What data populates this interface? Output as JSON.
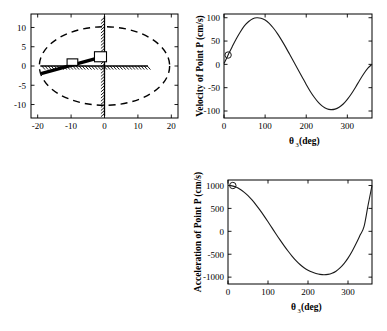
{
  "figure": {
    "title": "",
    "panels": [
      "mechanism-plot",
      "velocity-plot",
      "acceleration-plot"
    ]
  },
  "mechanism": {
    "name": "slider-crank-mechanism-diagram",
    "xlabel": "",
    "ylabel": "",
    "xticks": [
      "-20",
      "-10",
      "0",
      "10",
      "20"
    ],
    "xtick_values": [
      -20,
      -10,
      0,
      10,
      20
    ],
    "yticks": [
      "10",
      "5",
      "0",
      "-5",
      "-10"
    ],
    "ytick_values": [
      10,
      5,
      0,
      -5,
      -10
    ],
    "xlim": [
      -22,
      22
    ],
    "ylim": [
      -13.5,
      13.5
    ],
    "ellipse": {
      "cx": 0,
      "cy": 0,
      "rx": 19.5,
      "ry": 10.2,
      "style": "dashed"
    },
    "vertical_guide": {
      "x": 0,
      "y_from": -13.0,
      "y_to": 13.0,
      "hatch_side": "left"
    },
    "horizontal_guide": {
      "y": 0,
      "x_from": -19.2,
      "x_to": 13.0,
      "hatch_side": "below"
    },
    "bar": {
      "x1": -19.0,
      "y1": -2.0,
      "x2": -1.0,
      "y2": 2.3
    },
    "sliders": [
      {
        "name": "slider-a",
        "cx": -9.6,
        "cy": 1.0,
        "w": 3.2,
        "h": 1.7
      },
      {
        "name": "slider-b",
        "cx": -1.2,
        "cy": 2.4,
        "w": 3.6,
        "h": 2.6
      }
    ]
  },
  "velocity_chart": {
    "type": "line",
    "title": "",
    "xlabel_main": "θ",
    "xlabel_sub": "3",
    "xlabel_unit": " (deg)",
    "ylabel": "Velocity of Point P (cm/s)",
    "xlim": [
      0,
      360
    ],
    "ylim": [
      -115,
      108
    ],
    "xticks": [
      "0",
      "100",
      "200",
      "300"
    ],
    "xtick_values": [
      0,
      100,
      200,
      300
    ],
    "yticks": [
      "100",
      "50",
      "0",
      "-50",
      "-100"
    ],
    "ytick_values": [
      100,
      50,
      0,
      -50,
      -100
    ],
    "grid": false,
    "marker": {
      "x": 10,
      "y": 20,
      "shape": "circle"
    },
    "x": [
      0,
      10,
      20,
      30,
      40,
      50,
      60,
      70,
      80,
      90,
      100,
      110,
      120,
      130,
      140,
      150,
      160,
      170,
      180,
      190,
      200,
      210,
      220,
      230,
      240,
      250,
      260,
      270,
      280,
      290,
      300,
      310,
      320,
      330,
      340,
      350,
      360
    ],
    "values": [
      2,
      20,
      38,
      55,
      70,
      83,
      92,
      98,
      100,
      99,
      95,
      88,
      78,
      66,
      52,
      37,
      21,
      5,
      -11,
      -27,
      -43,
      -58,
      -71,
      -82,
      -90,
      -95,
      -97,
      -96,
      -92,
      -85,
      -75,
      -63,
      -49,
      -34,
      -20,
      -8,
      0
    ]
  },
  "acceleration_chart": {
    "type": "line",
    "title": "",
    "xlabel_main": "θ",
    "xlabel_sub": "3",
    "xlabel_unit": " (deg)",
    "ylabel": "Acceleration of Point P (cm/s)",
    "xlim": [
      0,
      360
    ],
    "ylim": [
      -1150,
      1120
    ],
    "xticks": [
      "0",
      "100",
      "200",
      "300"
    ],
    "xtick_values": [
      0,
      100,
      200,
      300
    ],
    "yticks": [
      "1000",
      "500",
      "0",
      "-500",
      "-1000"
    ],
    "ytick_values": [
      1000,
      500,
      0,
      -500,
      -1000
    ],
    "grid": false,
    "marker": {
      "x": 12,
      "y": 1000,
      "shape": "circle"
    },
    "x": [
      0,
      10,
      20,
      30,
      40,
      50,
      60,
      70,
      80,
      90,
      100,
      110,
      120,
      130,
      140,
      150,
      160,
      170,
      180,
      190,
      200,
      210,
      220,
      230,
      240,
      250,
      260,
      270,
      280,
      290,
      300,
      310,
      320,
      330,
      340,
      350,
      360
    ],
    "values": [
      1000,
      992,
      965,
      920,
      856,
      778,
      684,
      578,
      462,
      338,
      208,
      75,
      -58,
      -188,
      -312,
      -430,
      -540,
      -640,
      -725,
      -795,
      -848,
      -890,
      -920,
      -940,
      -948,
      -940,
      -915,
      -870,
      -800,
      -705,
      -585,
      -440,
      -272,
      -88,
      100,
      560,
      1000
    ]
  }
}
